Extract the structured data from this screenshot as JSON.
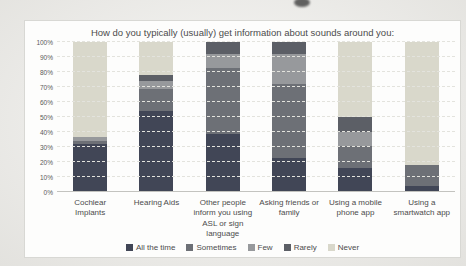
{
  "chart_data": {
    "type": "bar",
    "subtype": "stacked-100-percent",
    "title": "How do you typically (usually) get information about sounds around you:",
    "categories": [
      "Cochlear Implants",
      "Hearing Aids",
      "Other people inform you using ASL or sign language",
      "Asking friends or family",
      "Using a mobile phone app",
      "Using a smartwatch app"
    ],
    "series": [
      {
        "name": "All the time",
        "color": "#414656",
        "values": [
          32,
          54,
          39,
          23,
          16,
          4
        ]
      },
      {
        "name": "Sometimes",
        "color": "#6d7076",
        "values": [
          2,
          15,
          44,
          49,
          15,
          14
        ]
      },
      {
        "name": "Few",
        "color": "#97999c",
        "values": [
          3,
          5,
          9,
          20,
          9,
          0
        ]
      },
      {
        "name": "Rarely",
        "color": "#5c5f66",
        "values": [
          0,
          4,
          8,
          8,
          10,
          0
        ]
      },
      {
        "name": "Never",
        "color": "#d9d8cb",
        "values": [
          63,
          22,
          0,
          0,
          50,
          82
        ]
      }
    ],
    "y_axis": {
      "min": 0,
      "max": 100,
      "step": 10,
      "tick_labels": [
        "0%",
        "10%",
        "20%",
        "30%",
        "40%",
        "50%",
        "60%",
        "70%",
        "80%",
        "90%",
        "100%"
      ]
    },
    "legend": {
      "position": "bottom",
      "entries": [
        "All the time",
        "Sometimes",
        "Few",
        "Rarely",
        "Never"
      ]
    },
    "grid": true,
    "ylim": [
      0,
      100
    ]
  }
}
